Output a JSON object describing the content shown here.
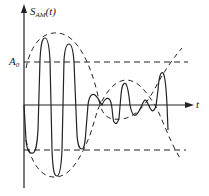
{
  "diagram": {
    "y_label": {
      "main": "S",
      "sub": "AM",
      "arg": "(t)"
    },
    "x_label": "t",
    "level_label": {
      "main": "A",
      "sub": "0"
    },
    "colors": {
      "stroke": "#222222",
      "background": "#ffffff"
    }
  }
}
